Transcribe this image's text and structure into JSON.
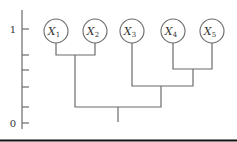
{
  "axis": {
    "x": 22,
    "y_top": 10,
    "y_bottom": 129,
    "ticks": [
      {
        "y": 29,
        "label": "1"
      },
      {
        "y": 55,
        "label": ""
      },
      {
        "y": 70,
        "label": ""
      },
      {
        "y": 87,
        "label": ""
      },
      {
        "y": 107,
        "label": ""
      },
      {
        "y": 123,
        "label": "0"
      }
    ]
  },
  "nodes": [
    {
      "id": "x1",
      "letter": "X",
      "sub": "1",
      "cx": 56,
      "cy": 31
    },
    {
      "id": "x2",
      "letter": "X",
      "sub": "2",
      "cx": 95,
      "cy": 31
    },
    {
      "id": "x3",
      "letter": "X",
      "sub": "3",
      "cx": 132,
      "cy": 31
    },
    {
      "id": "x4",
      "letter": "X",
      "sub": "4",
      "cx": 173,
      "cy": 31
    },
    {
      "id": "x5",
      "letter": "X",
      "sub": "5",
      "cx": 212,
      "cy": 31
    }
  ],
  "node_radius": 12,
  "branches": [
    {
      "name": "merge-x1-x2",
      "left_x": 56,
      "right_x": 95,
      "top_y": 43,
      "join_y": 55
    },
    {
      "name": "merge-x4-x5",
      "left_x": 173,
      "right_x": 212,
      "top_y": 43,
      "join_y": 69
    },
    {
      "name": "merge-x3-x45",
      "left_x": 132,
      "right_x": 193,
      "left_top_y": 43,
      "right_top_y": 69,
      "join_y": 86
    },
    {
      "name": "merge-root",
      "left_x": 75,
      "right_x": 161,
      "left_top_y": 55,
      "right_top_y": 86,
      "join_y": 107
    }
  ],
  "root_stem": {
    "x": 118,
    "y1": 107,
    "y2": 122
  },
  "colors": {
    "line": "#6b6b6b",
    "text": "#333333",
    "rule": "#111111"
  }
}
